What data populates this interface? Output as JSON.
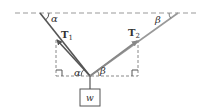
{
  "diagram": {
    "type": "force-diagram",
    "colors": {
      "rope_left": "#555555",
      "rope_right": "#888888",
      "dashed": "#888888",
      "text": "#333333"
    },
    "labels": {
      "tension_left": "T",
      "tension_left_sub": "1",
      "tension_right": "T",
      "tension_right_sub": "2",
      "angle_top_left": "α",
      "angle_top_right": "β",
      "angle_bottom_left": "α",
      "angle_bottom_right": "β",
      "weight": "w"
    },
    "points": {
      "ceiling_left_end": [
        15,
        13
      ],
      "ceiling_right_end": [
        197,
        13
      ],
      "anchor_left": [
        40,
        13
      ],
      "anchor_right": [
        178,
        13
      ],
      "junction": [
        90,
        76
      ],
      "T1_head": [
        56,
        39
      ],
      "T2_head": [
        138,
        40
      ],
      "box": {
        "x": 80,
        "y": 89,
        "w": 20,
        "h": 17
      }
    }
  }
}
